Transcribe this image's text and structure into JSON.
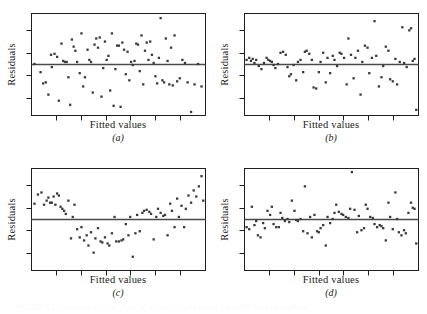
{
  "figure": {
    "background": "#ffffff",
    "ink": "#1f1f1f",
    "point_color": "#3a3a3a",
    "reference_line_color": "#4a4a4a",
    "bottom_caption": "FIGURE 4.2  Patterns for residual plots. (a) satisfactory, (b) funnel, (c) double bow, (d) nonlinear."
  },
  "panels": [
    {
      "key": "a",
      "label": "(a)",
      "xlabel": "Fitted values",
      "ylabel": "Residuals",
      "pattern": "satisfactory"
    },
    {
      "key": "b",
      "label": "(b)",
      "xlabel": "Fitted values",
      "ylabel": "Residuals",
      "pattern": "funnel"
    },
    {
      "key": "c",
      "label": "(c)",
      "xlabel": "Fitted values",
      "ylabel": "Residuals",
      "pattern": "double bow"
    },
    {
      "key": "d",
      "label": "(d)",
      "xlabel": "Fitted values",
      "ylabel": "Residuals",
      "pattern": "nonlinear"
    }
  ],
  "chart_data": [
    {
      "type": "scatter",
      "panel": "a",
      "title": "(a)",
      "xlabel": "Fitted values",
      "ylabel": "Residuals",
      "xlim": [
        0,
        100
      ],
      "ylim": [
        -50,
        50
      ],
      "grid": false,
      "legend": null,
      "xticks": [
        14.3,
        28.6,
        42.9,
        57.1,
        71.4,
        85.7
      ],
      "xticklabels": [],
      "yticks": [
        -33,
        -11,
        11,
        33
      ],
      "yticklabels": [],
      "reference_line": {
        "type": "hline",
        "y": 0
      },
      "annotations": [
        "random scatter / horizontal band — satisfactory"
      ],
      "x": [
        2.0,
        5.5,
        7.0,
        8.5,
        10.0,
        11.5,
        12.0,
        13.5,
        15.0,
        16.0,
        17.5,
        18.5,
        19.5,
        20.5,
        21.5,
        22.5,
        23.5,
        24.5,
        25.5,
        26.5,
        28.0,
        29.0,
        30.0,
        31.0,
        32.5,
        33.5,
        34.5,
        35.5,
        36.5,
        37.5,
        38.5,
        39.5,
        40.5,
        41.5,
        42.5,
        43.5,
        44.5,
        45.5,
        46.5,
        47.5,
        48.5,
        49.5,
        50.5,
        51.5,
        52.5,
        53.5,
        54.5,
        55.5,
        56.5,
        57.5,
        58.5,
        59.5,
        60.5,
        61.5,
        62.5,
        63.5,
        64.5,
        65.5,
        66.5,
        67.5,
        68.5,
        69.5,
        70.5,
        71.5,
        72.5,
        73.5,
        74.5,
        75.5,
        76.5,
        77.5,
        78.5,
        79.5,
        80.5,
        81.5,
        82.5,
        84.0,
        85.5,
        87.0,
        88.5,
        90.0,
        92.0,
        94.0,
        96.0,
        98.0
      ],
      "y": [
        0.0,
        -8.0,
        -19.0,
        -18.0,
        -30.0,
        9.0,
        -3.0,
        10.0,
        7.0,
        -36.0,
        20.0,
        3.0,
        2.0,
        2.0,
        -13.0,
        -40.0,
        24.0,
        17.0,
        13.0,
        2.0,
        -9.0,
        30.0,
        -22.0,
        -13.0,
        14.0,
        4.0,
        2.0,
        -28.0,
        19.0,
        25.0,
        16.0,
        26.0,
        -32.0,
        -4.0,
        22.0,
        4.0,
        8.0,
        -26.0,
        30.0,
        -41.0,
        -5.0,
        18.0,
        18.0,
        -42.0,
        21.0,
        14.0,
        -10.0,
        12.0,
        -16.0,
        2.0,
        -1.0,
        3.0,
        20.0,
        19.0,
        -7.0,
        28.0,
        -20.0,
        13.0,
        21.0,
        4.0,
        22.0,
        9.0,
        1.0,
        -12.0,
        -19.0,
        6.0,
        45.0,
        -16.0,
        -18.0,
        25.0,
        3.0,
        -20.0,
        16.0,
        -21.0,
        28.0,
        -17.0,
        -14.0,
        4.0,
        1.0,
        -18.0,
        -47.0,
        -20.0,
        0.0,
        -22.0
      ]
    },
    {
      "type": "scatter",
      "panel": "b",
      "title": "(b)",
      "xlabel": "Fitted values",
      "ylabel": "Residuals",
      "xlim": [
        0,
        100
      ],
      "ylim": [
        -50,
        50
      ],
      "grid": false,
      "legend": null,
      "xticks": [
        14.3,
        28.6,
        42.9,
        57.1,
        71.4,
        85.7
      ],
      "xticklabels": [],
      "yticks": [
        -33,
        -11,
        11,
        33
      ],
      "yticklabels": [],
      "reference_line": {
        "type": "hline",
        "y": 0
      },
      "annotations": [
        "variance increases with fitted values — funnel / megaphone"
      ],
      "x": [
        1.5,
        3.0,
        4.0,
        5.0,
        6.0,
        7.0,
        8.5,
        10.0,
        11.5,
        13.0,
        14.0,
        15.0,
        16.0,
        17.0,
        18.0,
        19.5,
        21.0,
        22.5,
        24.0,
        25.0,
        26.0,
        27.0,
        28.5,
        30.0,
        31.0,
        32.5,
        34.0,
        35.0,
        36.0,
        37.5,
        39.0,
        40.0,
        41.5,
        43.0,
        44.0,
        45.5,
        47.0,
        48.0,
        49.5,
        51.0,
        52.0,
        53.5,
        55.0,
        56.0,
        57.5,
        59.0,
        60.0,
        61.5,
        63.0,
        64.0,
        65.5,
        67.0,
        68.0,
        69.5,
        71.0,
        72.0,
        73.5,
        75.0,
        76.0,
        77.5,
        79.0,
        80.0,
        81.5,
        83.0,
        84.0,
        85.5,
        87.0,
        88.0,
        89.5,
        91.0,
        92.0,
        93.5,
        95.0,
        96.0,
        97.0,
        98.0,
        99.0
      ],
      "y": [
        4.0,
        6.0,
        3.0,
        5.0,
        1.0,
        4.0,
        -2.0,
        -5.0,
        1.0,
        6.0,
        4.0,
        3.0,
        2.0,
        -1.0,
        -4.0,
        0.0,
        11.0,
        12.0,
        9.0,
        -3.0,
        -12.0,
        -10.0,
        -1.0,
        -16.0,
        2.0,
        4.0,
        -8.0,
        12.0,
        13.0,
        10.0,
        4.0,
        -23.0,
        -24.0,
        -8.0,
        2.0,
        11.0,
        -18.0,
        6.0,
        -9.0,
        8.0,
        4.0,
        -2.0,
        11.0,
        10.0,
        6.0,
        -20.0,
        25.0,
        9.0,
        -14.0,
        6.0,
        13.0,
        -30.0,
        2.0,
        18.0,
        16.0,
        -9.0,
        6.0,
        42.0,
        8.0,
        -22.0,
        -13.0,
        -2.0,
        17.0,
        13.0,
        -15.0,
        -17.0,
        5.0,
        -20.0,
        2.0,
        36.0,
        1.0,
        -3.0,
        33.0,
        35.0,
        3.0,
        5.0,
        -45.0
      ]
    },
    {
      "type": "scatter",
      "panel": "c",
      "title": "(c)",
      "xlabel": "Fitted values",
      "ylabel": "Residuals",
      "xlim": [
        0,
        100
      ],
      "ylim": [
        -50,
        50
      ],
      "grid": false,
      "legend": null,
      "xticks": [
        14.3,
        28.6,
        42.9,
        57.1,
        71.4,
        85.7
      ],
      "xticklabels": [],
      "yticks": [
        -33,
        -11,
        11,
        33
      ],
      "yticklabels": [],
      "reference_line": {
        "type": "hline",
        "y": 0
      },
      "annotations": [
        "U-shaped curvilinear pattern — double bow / nonlinearity"
      ],
      "x": [
        2.0,
        4.0,
        6.0,
        7.5,
        9.0,
        10.0,
        11.0,
        12.0,
        13.0,
        14.0,
        15.0,
        16.0,
        17.0,
        18.0,
        19.0,
        20.0,
        21.5,
        23.0,
        24.0,
        25.0,
        26.5,
        28.0,
        29.0,
        30.5,
        32.0,
        33.0,
        34.5,
        36.0,
        37.0,
        38.5,
        40.0,
        41.0,
        42.5,
        44.0,
        45.0,
        46.5,
        48.0,
        49.0,
        50.5,
        52.0,
        53.0,
        54.5,
        56.0,
        57.0,
        58.5,
        60.0,
        61.0,
        62.5,
        64.0,
        65.0,
        66.5,
        68.0,
        69.0,
        70.5,
        72.0,
        73.0,
        74.5,
        76.0,
        77.0,
        78.5,
        80.0,
        81.0,
        82.5,
        84.0,
        85.0,
        86.5,
        88.0,
        89.0,
        90.5,
        92.0,
        93.5,
        95.0,
        96.5,
        98.0,
        99.0
      ],
      "y": [
        15.0,
        24.0,
        26.0,
        14.0,
        18.0,
        21.0,
        16.0,
        16.0,
        22.0,
        14.0,
        25.0,
        23.0,
        12.0,
        10.0,
        8.0,
        5.0,
        18.0,
        -19.0,
        2.0,
        14.0,
        -10.0,
        -18.0,
        -8.0,
        -21.0,
        -16.0,
        -26.0,
        -13.0,
        -33.0,
        -19.0,
        -9.0,
        -22.0,
        -23.0,
        -18.0,
        -24.0,
        -26.0,
        -14.0,
        2.0,
        -22.0,
        -22.0,
        -21.0,
        -20.0,
        -5.0,
        -16.0,
        2.0,
        -37.0,
        -14.0,
        4.0,
        -12.0,
        6.0,
        8.0,
        9.0,
        7.0,
        5.0,
        -20.0,
        2.0,
        10.0,
        6.0,
        3.0,
        4.0,
        -16.0,
        15.0,
        8.0,
        -8.0,
        20.0,
        2.0,
        13.0,
        -8.0,
        10.0,
        23.0,
        16.0,
        28.0,
        22.0,
        32.0,
        42.0,
        18.0
      ]
    },
    {
      "type": "scatter",
      "panel": "d",
      "title": "(d)",
      "xlabel": "Fitted values",
      "ylabel": "Residuals",
      "xlim": [
        0,
        100
      ],
      "ylim": [
        -50,
        50
      ],
      "grid": false,
      "legend": null,
      "xticks": [
        14.3,
        28.6,
        42.9,
        57.1,
        71.4,
        85.7
      ],
      "xticklabels": [],
      "yticks": [
        -33,
        -11,
        11,
        33
      ],
      "yticklabels": [],
      "reference_line": {
        "type": "hline",
        "y": 0
      },
      "annotations": [
        "dense band with scattered high outliers — nonlinear"
      ],
      "x": [
        1.5,
        3.0,
        4.5,
        6.0,
        7.0,
        8.0,
        9.5,
        11.0,
        12.0,
        13.5,
        15.0,
        16.0,
        17.0,
        18.5,
        20.0,
        21.0,
        22.0,
        23.5,
        25.0,
        26.0,
        27.5,
        29.0,
        30.0,
        31.0,
        32.5,
        34.0,
        35.0,
        36.5,
        38.0,
        39.0,
        40.5,
        42.0,
        43.0,
        44.0,
        45.5,
        47.0,
        48.0,
        49.5,
        51.0,
        52.0,
        53.0,
        54.5,
        56.0,
        57.0,
        58.5,
        60.0,
        61.0,
        62.0,
        63.5,
        65.0,
        66.0,
        67.5,
        69.0,
        70.0,
        71.0,
        72.5,
        74.0,
        75.0,
        76.5,
        78.0,
        79.0,
        80.0,
        81.5,
        83.0,
        84.0,
        85.5,
        87.0,
        88.0,
        89.0,
        90.5,
        92.0,
        93.0,
        94.5,
        96.0,
        97.0,
        98.0,
        99.0
      ],
      "y": [
        -8.0,
        -10.0,
        12.0,
        -6.0,
        -2.0,
        -16.0,
        -18.0,
        -4.0,
        -9.0,
        8.0,
        4.0,
        12.0,
        -5.0,
        -8.0,
        -8.0,
        6.0,
        1.0,
        -2.0,
        0.0,
        -3.0,
        18.0,
        8.0,
        -1.0,
        -2.0,
        0.0,
        -12.0,
        32.0,
        -14.0,
        2.0,
        -18.0,
        4.0,
        -12.0,
        -13.0,
        -9.0,
        -6.0,
        -26.0,
        2.0,
        -4.0,
        0.0,
        6.0,
        14.0,
        7.0,
        5.0,
        4.0,
        2.0,
        1.0,
        10.0,
        46.0,
        9.0,
        -13.0,
        3.0,
        -11.0,
        -9.0,
        14.0,
        10.0,
        2.0,
        1.0,
        -5.0,
        -8.0,
        -6.0,
        -7.0,
        -9.0,
        -21.0,
        16.0,
        2.0,
        -10.0,
        26.0,
        0.0,
        -13.0,
        -16.0,
        -11.0,
        -14.0,
        6.0,
        16.0,
        11.0,
        10.0,
        -24.0
      ]
    }
  ]
}
